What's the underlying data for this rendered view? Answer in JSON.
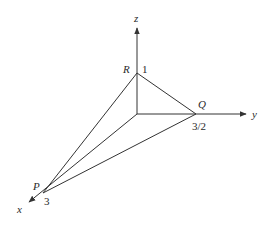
{
  "diagram": {
    "type": "3d-coordinate-tetrahedron",
    "axes": {
      "x": {
        "label": "x"
      },
      "y": {
        "label": "y"
      },
      "z": {
        "label": "z"
      }
    },
    "points": {
      "P": {
        "label": "P",
        "value_label": "3",
        "coords": [
          3,
          0,
          0
        ]
      },
      "Q": {
        "label": "Q",
        "value_label": "3/2",
        "coords": [
          0,
          1.5,
          0
        ]
      },
      "R": {
        "label": "R",
        "value_label": "1",
        "coords": [
          0,
          0,
          1
        ]
      }
    },
    "edges": [
      "OP",
      "OQ",
      "OR",
      "PQ",
      "PR",
      "QR"
    ],
    "line_color": "#333333"
  }
}
